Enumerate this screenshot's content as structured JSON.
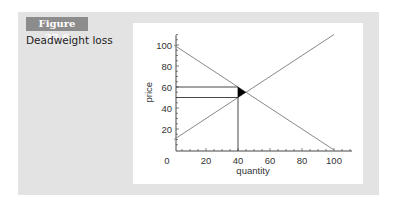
{
  "figure": {
    "label": "Figure 27.6",
    "title": "Deadweight loss"
  },
  "chart_data": {
    "type": "line",
    "title": "Deadweight loss",
    "xlabel": "quantity",
    "ylabel": "price",
    "xlim": [
      0,
      110
    ],
    "ylim": [
      0,
      110
    ],
    "x_ticks": [
      0,
      20,
      40,
      60,
      80,
      100
    ],
    "y_ticks": [
      20,
      40,
      60,
      80,
      100
    ],
    "grid": false,
    "series": [
      {
        "name": "demand",
        "x": [
          0,
          100
        ],
        "y": [
          100,
          0
        ]
      },
      {
        "name": "supply",
        "x": [
          0,
          100
        ],
        "y": [
          10,
          110
        ]
      }
    ],
    "annotations": {
      "quantity_restriction": 40,
      "demand_price_at_restriction": 60,
      "supply_price_at_restriction": 50,
      "equilibrium": {
        "quantity": 45,
        "price": 55
      },
      "deadweight_loss_triangle": [
        [
          40,
          60
        ],
        [
          40,
          50
        ],
        [
          45,
          55
        ]
      ]
    }
  }
}
